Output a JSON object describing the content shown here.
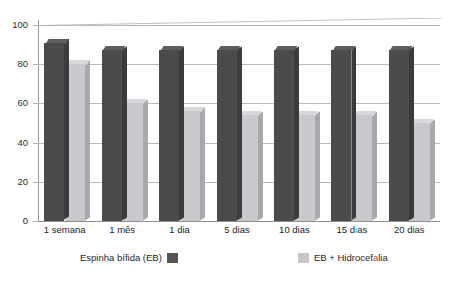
{
  "chart_data": {
    "type": "bar",
    "title": "",
    "subtitle": "",
    "xlabel": "",
    "ylabel": "",
    "ylim": [
      0,
      100
    ],
    "yticks": [
      0,
      20,
      40,
      60,
      80,
      100
    ],
    "grid": true,
    "legend_position": "bottom",
    "categories": [
      "1 semana",
      "1 mês",
      "1 dia",
      "5 dias",
      "10 dias",
      "15 d as",
      "20 dias"
    ],
    "series": [
      {
        "name": "Espinha bífida (EB)",
        "color": "#4b4b4b",
        "values": [
          91,
          87,
          87,
          87,
          87,
          87,
          87
        ]
      },
      {
        "name": "EB + Hidrocefalia",
        "color": "#c9c9cd",
        "values": [
          80,
          60,
          56,
          54,
          54,
          54,
          50
        ]
      }
    ]
  },
  "y_axis": {
    "ticks": [
      "100",
      "80",
      "60",
      "40",
      "20",
      "0"
    ]
  },
  "x_axis": {
    "labels": [
      {
        "text": "1 semana",
        "faded_char": ""
      },
      {
        "text": "1 mês",
        "faded_char": ""
      },
      {
        "text": "1 dia",
        "faded_char": ""
      },
      {
        "text": "5 dias",
        "faded_char": ""
      },
      {
        "text": "10 dias",
        "faded_char": ""
      },
      {
        "text": "15 d as",
        "faded_char": "i"
      },
      {
        "text": "20 dias",
        "faded_char": ""
      }
    ]
  },
  "legend": {
    "items": [
      {
        "label": "Espinha bífida (EB)",
        "swatch": "dark",
        "swatch_side": "right",
        "color": "#545454"
      },
      {
        "label": "EB + Hidrocefalia",
        "swatch": "light",
        "swatch_side": "left",
        "color": "#c6c6ca"
      }
    ]
  },
  "artifacts": {
    "cyan_edge_group_index": 5,
    "cyan_edge_color": "#2aa8b4"
  }
}
